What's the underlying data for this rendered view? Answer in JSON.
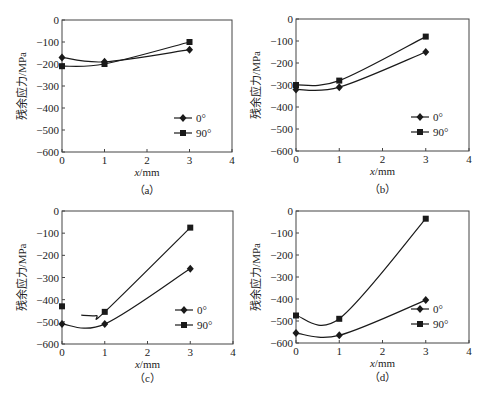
{
  "figure": {
    "legend_entries": [
      "0°",
      "90°"
    ],
    "ylabel": "残余应力/MPa",
    "xlabel": "x/mm",
    "line_color": "#1a1a1a"
  },
  "chart_data": [
    {
      "type": "line",
      "panel_label": "（a）",
      "xlabel": "x/mm",
      "ylabel": "残余应力/MPa",
      "xlim": [
        0,
        4
      ],
      "ylim": [
        -600,
        0
      ],
      "xticks": [
        0,
        1,
        2,
        3,
        4
      ],
      "yticks": [
        0,
        -100,
        -200,
        -300,
        -400,
        -500,
        -600
      ],
      "legend_position": "lower right",
      "grid": false,
      "series": [
        {
          "name": "0°",
          "marker": "diamond",
          "x": [
            0,
            1,
            3
          ],
          "values": [
            -170,
            -190,
            -135
          ]
        },
        {
          "name": "90°",
          "marker": "square",
          "x": [
            0,
            1,
            3
          ],
          "values": [
            -210,
            -200,
            -100
          ]
        }
      ]
    },
    {
      "type": "line",
      "panel_label": "（b）",
      "xlabel": "x/mm",
      "ylabel": "残余应力/MPa",
      "xlim": [
        0,
        4
      ],
      "ylim": [
        -600,
        0
      ],
      "xticks": [
        0,
        1,
        2,
        3,
        4
      ],
      "yticks": [
        0,
        -100,
        -200,
        -300,
        -400,
        -500,
        -600
      ],
      "legend_position": "lower right",
      "grid": false,
      "series": [
        {
          "name": "0°",
          "marker": "diamond",
          "x": [
            0,
            1,
            3
          ],
          "values": [
            -320,
            -310,
            -150
          ]
        },
        {
          "name": "90°",
          "marker": "square",
          "x": [
            0,
            1,
            3
          ],
          "values": [
            -300,
            -280,
            -80
          ]
        }
      ]
    },
    {
      "type": "line",
      "panel_label": "（c）",
      "xlabel": "x/mm",
      "ylabel": "残余应力/MPa",
      "xlim": [
        0,
        4
      ],
      "ylim": [
        -600,
        0
      ],
      "xticks": [
        0,
        1,
        2,
        3,
        4
      ],
      "yticks": [
        0,
        -100,
        -200,
        -300,
        -400,
        -500,
        -600
      ],
      "legend_position": "lower right",
      "grid": false,
      "series": [
        {
          "name": "0°",
          "marker": "diamond",
          "x": [
            0,
            1,
            3
          ],
          "values": [
            -510,
            -510,
            -260
          ]
        },
        {
          "name": "90°",
          "marker": "square",
          "x": [
            0,
            1,
            3
          ],
          "values": [
            -430,
            -455,
            -75
          ],
          "curve_start_x": 0.45
        }
      ]
    },
    {
      "type": "line",
      "panel_label": "（d）",
      "xlabel": "x/mm",
      "ylabel": "残余应力/MPa",
      "xlim": [
        0,
        4
      ],
      "ylim": [
        -600,
        0
      ],
      "xticks": [
        0,
        1,
        2,
        3,
        4
      ],
      "yticks": [
        0,
        -100,
        -200,
        -300,
        -400,
        -500,
        -600
      ],
      "legend_position": "lower right",
      "grid": false,
      "series": [
        {
          "name": "0°",
          "marker": "diamond",
          "x": [
            0,
            1,
            3
          ],
          "values": [
            -555,
            -565,
            -405
          ]
        },
        {
          "name": "90°",
          "marker": "square",
          "x": [
            0,
            1,
            3
          ],
          "values": [
            -475,
            -490,
            -35
          ]
        }
      ]
    }
  ],
  "layout": {
    "panels": [
      {
        "left": 62,
        "right": 232,
        "top": 20,
        "bottom": 152
      },
      {
        "left": 296,
        "right": 469,
        "top": 19,
        "bottom": 151
      },
      {
        "left": 62,
        "right": 233,
        "top": 211,
        "bottom": 344
      },
      {
        "left": 296,
        "right": 469,
        "top": 211,
        "bottom": 343
      }
    ]
  }
}
